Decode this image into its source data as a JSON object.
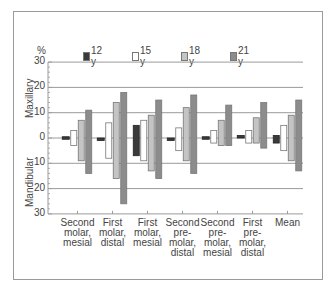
{
  "chart_data": {
    "type": "bar",
    "subtype": "floating-range-bar",
    "title": "",
    "ylabel": "%",
    "y_regions": {
      "upper": "Maxillary",
      "lower": "Mandibular"
    },
    "ylim": [
      -30,
      30
    ],
    "yticks": [
      30,
      20,
      10,
      0,
      -10,
      -20,
      -30
    ],
    "ytick_labels": [
      "30",
      "20",
      "10",
      "0",
      "10",
      "20",
      "30"
    ],
    "grid": "horizontal",
    "legend_position": "top",
    "categories": [
      "Second\nmolar,\nmesial",
      "First\nmolar,\ndistal",
      "First\nmolar,\nmesial",
      "Second\npre-\nmolar,\ndistal",
      "Second\npre-\nmolar,\nmesial",
      "First\npre-\nmolar,\ndistal",
      "Mean"
    ],
    "series": [
      {
        "name": "12 y",
        "color": "#3a3a3a",
        "ranges": [
          [
            0.5,
            -0.5
          ],
          [
            0,
            -1
          ],
          [
            5,
            -7
          ],
          [
            0,
            -1
          ],
          [
            0.5,
            -0.5
          ],
          [
            1,
            0
          ],
          [
            1,
            -2
          ]
        ]
      },
      {
        "name": "15 y",
        "color": "#ffffff",
        "ranges": [
          [
            3,
            -3
          ],
          [
            6,
            -8
          ],
          [
            7,
            -9
          ],
          [
            4,
            -5
          ],
          [
            3,
            -2
          ],
          [
            3,
            -2
          ],
          [
            5,
            -5
          ]
        ]
      },
      {
        "name": "18 y",
        "color": "#c4c4c4",
        "ranges": [
          [
            7,
            -9
          ],
          [
            14,
            -16
          ],
          [
            9,
            -13
          ],
          [
            12,
            -9
          ],
          [
            7,
            -3
          ],
          [
            8,
            -2
          ],
          [
            9,
            -9
          ]
        ]
      },
      {
        "name": "21 y",
        "color": "#8c8c8c",
        "ranges": [
          [
            11,
            -14
          ],
          [
            18,
            -26
          ],
          [
            15,
            -16
          ],
          [
            17,
            -14
          ],
          [
            13,
            -3
          ],
          [
            14,
            -4
          ],
          [
            15,
            -13
          ]
        ]
      }
    ]
  },
  "legend": {
    "pct_label": "%",
    "items": [
      {
        "label": "12 y",
        "color": "#3a3a3a"
      },
      {
        "label": "15 y",
        "color": "#ffffff"
      },
      {
        "label": "18 y",
        "color": "#c4c4c4"
      },
      {
        "label": "21 y",
        "color": "#8c8c8c"
      }
    ]
  },
  "axis": {
    "maxillary": "Maxillary",
    "mandibular": "Mandibular"
  }
}
